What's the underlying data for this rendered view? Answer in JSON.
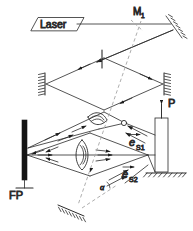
{
  "figure": {
    "type": "optical-interferometer-schematic",
    "width": 193,
    "height": 231,
    "background": "#ffffff",
    "line_color": "#2a2a2a",
    "dashed_color": "#9a9a9a"
  },
  "labels": {
    "laser": "Laser",
    "mirror_m1": "M",
    "mirror_m1_sub": "1",
    "fabry_perot": "FP",
    "probe": "P",
    "e_s1_base": "e",
    "e_s1_sub": "S1",
    "e_s2_base": "e",
    "e_s2_sub": "S2",
    "alpha": "α"
  },
  "components": [
    {
      "name": "laser-source",
      "kind": "parallelogram-box",
      "label": "Laser"
    },
    {
      "name": "mirror-m1",
      "kind": "hatched-mirror",
      "label": "M1"
    },
    {
      "name": "mirror-top-right",
      "kind": "hatched-mirror",
      "label": ""
    },
    {
      "name": "mirror-mid-left",
      "kind": "hatched-mirror",
      "label": ""
    },
    {
      "name": "mirror-mid-right",
      "kind": "hatched-mirror",
      "label": ""
    },
    {
      "name": "aperture-stop",
      "kind": "vertical-slit",
      "label": ""
    },
    {
      "name": "mirror-bottom",
      "kind": "hatched-mirror",
      "label": ""
    },
    {
      "name": "lens-upper",
      "kind": "biconvex-lens",
      "label": ""
    },
    {
      "name": "lens-lower",
      "kind": "biconvex-lens",
      "label": ""
    },
    {
      "name": "fabry-perot-etalon",
      "kind": "thick-bar-on-stand",
      "label": "FP"
    },
    {
      "name": "sample-probe",
      "kind": "rect-on-ground",
      "label": "P"
    },
    {
      "name": "scatter-point",
      "kind": "open-circle",
      "label": ""
    }
  ],
  "vectors": [
    {
      "name": "e-s1",
      "label": "eS1",
      "description": "scattering direction 1"
    },
    {
      "name": "e-s2",
      "label": "eS2",
      "description": "scattering direction 2"
    }
  ]
}
